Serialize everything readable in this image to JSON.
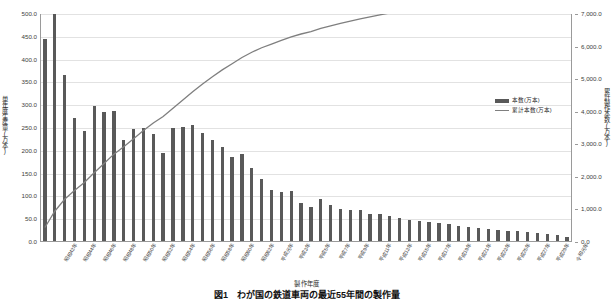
{
  "chart_data": {
    "type": "bar",
    "title": "",
    "xlabel": "製作年度",
    "ylabel": "単年度生産量(万本)",
    "y2label": "累計製作本数(万本)",
    "ylim": [
      0,
      500
    ],
    "y2lim": [
      0,
      7000
    ],
    "grid": true,
    "legend_position": "inside-right",
    "yticks": [
      "0.0",
      "50.0",
      "100.0",
      "150.0",
      "200.0",
      "250.0",
      "300.0",
      "350.0",
      "400.0",
      "450.0",
      "500.0"
    ],
    "y2ticks": [
      "0.0",
      "1,000.0",
      "2,000.0",
      "3,000.0",
      "4,000.0",
      "5,000.0",
      "6,000.0",
      "7,000.0"
    ],
    "categories": [
      "昭和41年",
      "昭和42年",
      "昭和43年",
      "昭和44年",
      "昭和45年",
      "昭和46年",
      "昭和47年",
      "昭和48年",
      "昭和49年",
      "昭和50年",
      "昭和51年",
      "昭和52年",
      "昭和53年",
      "昭和54年",
      "昭和55年",
      "昭和56年",
      "昭和57年",
      "昭和58年",
      "昭和59年",
      "昭和60年",
      "昭和61年",
      "昭和62年",
      "昭和63年",
      "平成元年",
      "平成2年",
      "平成3年",
      "平成4年",
      "平成5年",
      "平成6年",
      "平成7年",
      "平成8年",
      "平成9年",
      "平成10年",
      "平成11年",
      "平成12年",
      "平成13年",
      "平成14年",
      "平成15年",
      "平成16年",
      "平成17年",
      "平成18年",
      "平成19年",
      "平成20年",
      "平成21年",
      "平成22年",
      "平成23年",
      "平成24年",
      "平成25年",
      "平成26年",
      "平成27年",
      "平成28年",
      "平成29年",
      "平成30年",
      "令和元年"
    ],
    "xtick_labels_shown": [
      "昭和42年",
      "昭和44年",
      "昭和46年",
      "昭和48年",
      "昭和50年",
      "昭和52年",
      "昭和54年",
      "昭和56年",
      "昭和58年",
      "昭和60年",
      "昭和62年",
      "平成元年",
      "平成3年",
      "平成5年",
      "平成7年",
      "平成9年",
      "平成11年",
      "平成13年",
      "平成15年",
      "平成17年",
      "平成19年",
      "平成21年",
      "平成23年",
      "平成25年",
      "平成27年",
      "平成29年",
      "令和元年"
    ],
    "series": [
      {
        "name": "本数(万本)",
        "type": "bar",
        "axis": "left",
        "color": "#595959",
        "values": [
          446,
          499,
          367,
          271,
          244,
          298,
          285,
          287,
          224,
          248,
          251,
          236,
          196,
          251,
          253,
          256,
          240,
          224,
          209,
          187,
          192,
          162,
          138,
          114,
          110,
          112,
          86,
          76,
          95,
          82,
          72,
          70,
          70,
          62,
          62,
          56,
          53,
          48,
          45,
          44,
          42,
          40,
          35,
          32,
          30,
          28,
          27,
          25,
          24,
          22,
          19,
          17,
          15,
          12
        ]
      },
      {
        "name": "累計本数(万本)",
        "type": "line",
        "axis": "right",
        "color": "#7f7f7f",
        "values": [
          446,
          945,
          1312,
          1583,
          1827,
          2125,
          2410,
          2697,
          2921,
          3169,
          3420,
          3656,
          3852,
          4103,
          4356,
          4612,
          4852,
          5076,
          5285,
          5472,
          5664,
          5826,
          5964,
          6078,
          6188,
          6300,
          6386,
          6462,
          6557,
          6639,
          6711,
          6781,
          6851,
          6913,
          6975,
          7031,
          7084,
          7132,
          7177,
          7221,
          7263,
          7303,
          7338,
          7370,
          7400,
          7428,
          7455,
          7480,
          7504,
          7526,
          7545,
          7562,
          7577,
          7589
        ],
        "displayed_values": [
          446,
          945,
          1312,
          1583,
          1827,
          2125,
          2410,
          2697,
          2921,
          3169,
          3420,
          3656,
          3852,
          4103,
          4356,
          4612,
          4852,
          5076,
          5285,
          5472,
          5664,
          5826,
          5964,
          6078,
          6188,
          6300,
          6386,
          6462,
          6557,
          6639,
          6711,
          6781,
          6851,
          6913,
          6975,
          7031,
          7084,
          7132,
          7177,
          7221,
          7263,
          7303,
          7338,
          7370,
          7400,
          7428,
          7455,
          7480,
          7504,
          7526,
          7545,
          7562,
          7577,
          7589
        ]
      }
    ]
  },
  "legend": {
    "entries": [
      {
        "label": "本数(万本)",
        "marker": "bar"
      },
      {
        "label": "累計本数(万本)",
        "marker": "line"
      }
    ]
  },
  "caption": "図1　わが国の鉄道車両の最近55年間の製作量"
}
